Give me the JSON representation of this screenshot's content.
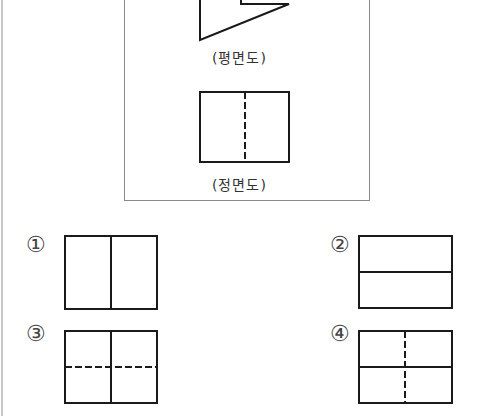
{
  "problem": {
    "given_views": {
      "plan_view": {
        "label": "(평면도)",
        "shape": "polygon-partial",
        "points": [
          [
            200,
            0
          ],
          [
            200,
            40
          ],
          [
            289,
            4
          ],
          [
            241,
            4
          ],
          [
            241,
            0
          ]
        ]
      },
      "front_view": {
        "label": "(정면도)",
        "shape": "rectangle",
        "rect": {
          "x": 200,
          "y": 92,
          "w": 89,
          "h": 70
        },
        "hidden_line": "vertical-center-dashed"
      }
    },
    "choices": [
      {
        "number": "①",
        "description": "rectangle with solid vertical center line"
      },
      {
        "number": "②",
        "description": "rectangle with solid horizontal center line"
      },
      {
        "number": "③",
        "description": "rectangle with solid vertical center line and dashed horizontal center line"
      },
      {
        "number": "④",
        "description": "rectangle with solid horizontal center line and dashed vertical center line"
      }
    ]
  },
  "colors": {
    "line": "#1a1a1a",
    "panel_border": "#8a8a8a",
    "left_rule": "#c8c8c8",
    "text": "#333333"
  }
}
